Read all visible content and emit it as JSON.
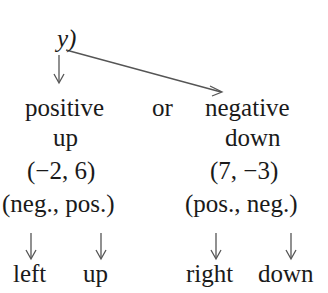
{
  "diagram": {
    "root": "y)",
    "connector": "or",
    "branches": [
      {
        "sign": "positive",
        "direction": "up",
        "example": "(−2, 6)",
        "signs": "(neg., pos.)",
        "results": [
          "left",
          "up"
        ]
      },
      {
        "sign": "negative",
        "direction": "down",
        "example": "(7, −3)",
        "signs": "(pos., neg.)",
        "results": [
          "right",
          "down"
        ]
      }
    ]
  }
}
